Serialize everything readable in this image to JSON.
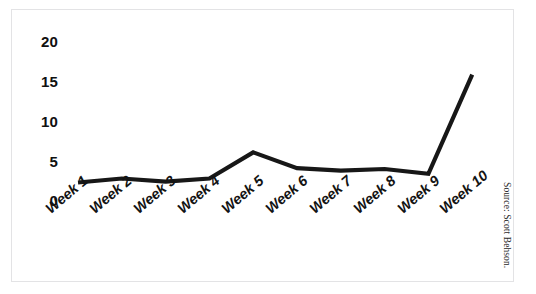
{
  "chart_data": {
    "type": "line",
    "title": "",
    "subtitle": "",
    "xlabel": "",
    "ylabel": "",
    "categories": [
      "Week 1",
      "Week 2",
      "Week 3",
      "Week 4",
      "Week 5",
      "Week 6",
      "Week 7",
      "Week 8",
      "Week 9",
      "Week 10"
    ],
    "values": [
      1.2,
      1.7,
      1.3,
      1.7,
      5.0,
      3.0,
      2.7,
      2.9,
      2.3,
      14.8
    ],
    "series": [
      {
        "name": "",
        "values": [
          1.2,
          1.7,
          1.3,
          1.7,
          5.0,
          3.0,
          2.7,
          2.9,
          2.3,
          14.8
        ]
      }
    ],
    "ylim": [
      0,
      20
    ],
    "ytick_labels": [
      "0",
      "5",
      "10",
      "15",
      "20"
    ],
    "ytick_values": [
      0,
      5,
      10,
      15,
      20
    ],
    "grid": false,
    "legend": false,
    "legend_position": "none",
    "line_color": "#171717",
    "annotations": []
  },
  "axes": {
    "y_ticks": [
      {
        "label": "20",
        "value": 20
      },
      {
        "label": "15",
        "value": 15
      },
      {
        "label": "10",
        "value": 10
      },
      {
        "label": "5",
        "value": 5
      },
      {
        "label": "0",
        "value": 0
      }
    ],
    "x_ticks": [
      {
        "label": "Week 1"
      },
      {
        "label": "Week 2"
      },
      {
        "label": "Week 3"
      },
      {
        "label": "Week 4"
      },
      {
        "label": "Week 5"
      },
      {
        "label": "Week 6"
      },
      {
        "label": "Week 7"
      },
      {
        "label": "Week 8"
      },
      {
        "label": "Week 9"
      },
      {
        "label": "Week 10"
      }
    ]
  },
  "footer": {
    "source": "Source: Scott Behson."
  },
  "colors": {
    "line": "#171717",
    "frame_border": "#e3e3e5",
    "background": "#ffffff",
    "tick_text": "#101010"
  }
}
